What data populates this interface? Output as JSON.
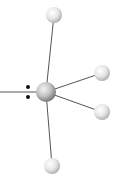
{
  "diagram": {
    "type": "molecular-geometry",
    "colors": {
      "background": "#ffffff",
      "bond": "#555555",
      "atom_light": "#ffffff",
      "atom_mid": "#d8d8d8",
      "atom_dark": "#9a9a9a",
      "central_dark": "#7a7a7a",
      "lone_pair": "#111111"
    },
    "central_atom": {
      "cx": 46,
      "cy": 92,
      "r": 10
    },
    "bonded_atoms": [
      {
        "name": "top",
        "cx": 54,
        "cy": 15,
        "r": 8
      },
      {
        "name": "right-upper",
        "cx": 102,
        "cy": 73,
        "r": 8
      },
      {
        "name": "right-lower",
        "cx": 102,
        "cy": 112,
        "r": 8
      },
      {
        "name": "bottom",
        "cx": 52,
        "cy": 166,
        "r": 8
      }
    ],
    "lone_pair": {
      "dots": [
        {
          "cx": 28,
          "cy": 87
        },
        {
          "cx": 28,
          "cy": 97
        }
      ],
      "line": {
        "x1": 0,
        "y1": 92,
        "x2": 37,
        "y2": 92
      }
    }
  }
}
